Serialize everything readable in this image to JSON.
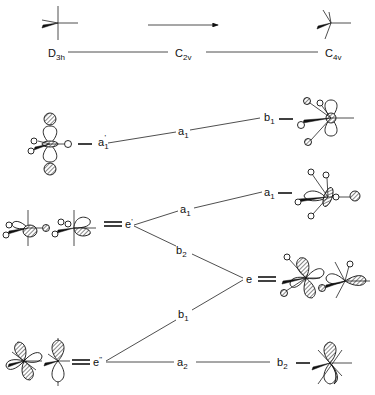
{
  "diagram": {
    "type": "correlation-diagram",
    "header": {
      "arrow": "right-arrow",
      "symmetries": [
        "D3h",
        "C2v",
        "C4v"
      ],
      "left": {
        "main": "D",
        "sub": "3h"
      },
      "middle": {
        "main": "C",
        "sub": "2v"
      },
      "right": {
        "main": "C",
        "sub": "4v"
      }
    },
    "levels": {
      "d3h": [
        {
          "id": "a1p",
          "main": "a",
          "sub": "1",
          "sup": "'"
        },
        {
          "id": "ep",
          "main": "e",
          "sup": "'"
        },
        {
          "id": "epp",
          "main": "e",
          "sup": "\""
        }
      ],
      "c2v": [
        {
          "id": "c2v_a1_top",
          "main": "a",
          "sub": "1"
        },
        {
          "id": "c2v_a1_mid",
          "main": "a",
          "sub": "1"
        },
        {
          "id": "c2v_b2",
          "main": "b",
          "sub": "2"
        },
        {
          "id": "c2v_b1",
          "main": "b",
          "sub": "1"
        },
        {
          "id": "c2v_a2",
          "main": "a",
          "sub": "2"
        }
      ],
      "c4v": [
        {
          "id": "b1",
          "main": "b",
          "sub": "1"
        },
        {
          "id": "a1",
          "main": "a",
          "sub": "1"
        },
        {
          "id": "e",
          "main": "e"
        },
        {
          "id": "b2",
          "main": "b",
          "sub": "2"
        }
      ]
    },
    "correlations": [
      {
        "from": "a1'",
        "via": "a1",
        "to": "b1"
      },
      {
        "from": "e'",
        "via": "a1",
        "to": "a1"
      },
      {
        "from": "e'",
        "via": "b2",
        "to": "e"
      },
      {
        "from": "e\"",
        "via": "b1",
        "to": "e"
      },
      {
        "from": "e\"",
        "via": "a2",
        "to": "b2"
      }
    ],
    "orbital_icons": [
      "d3h-structure-icon",
      "c4v-structure-icon",
      "a1-prime-orbital-icon",
      "b1-orbital-icon",
      "e-prime-orbital-pair-icon",
      "a1-orbital-icon",
      "e-orbital-pair-icon",
      "e-double-prime-orbital-pair-icon",
      "b2-orbital-icon"
    ]
  }
}
